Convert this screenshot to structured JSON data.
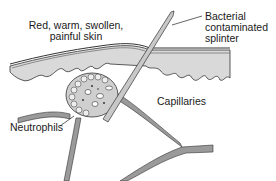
{
  "diagram": {
    "title": "",
    "labels": {
      "skin": "Red, warm, swollen,\npainful skin",
      "splinter": "Bacterial\ncontaminated\nsplinter",
      "capillaries": "Capillaries",
      "neutrophils": "Neutrophils"
    },
    "elements": [
      {
        "name": "skin-surface",
        "description": "epidermis layer with wavy dermal border"
      },
      {
        "name": "splinter",
        "description": "bacterial contaminated splinter piercing skin"
      },
      {
        "name": "inflammation-site",
        "description": "cluster of cells around splinter"
      },
      {
        "name": "capillaries",
        "description": "branching blood vessels"
      },
      {
        "name": "neutrophils",
        "description": "white blood cells migrating from capillary"
      }
    ],
    "colors": {
      "skin_fill": "#d9d9d9",
      "skin_outline": "#333333",
      "capillary_fill": "#9a9a9a",
      "splinter_fill": "#c8c8c8",
      "text": "#1a1a1a"
    }
  }
}
